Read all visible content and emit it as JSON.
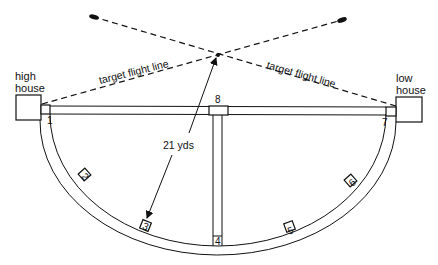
{
  "diagram": {
    "type": "skeet-field-layout",
    "houses": {
      "high": {
        "label_line1": "high",
        "label_line2": "house"
      },
      "low": {
        "label_line1": "low",
        "label_line2": "house"
      }
    },
    "flight_lines": {
      "left_label": "target flight line",
      "right_label": "target flight line"
    },
    "distance": {
      "label": "21 yds"
    },
    "stations": [
      {
        "number": "1"
      },
      {
        "number": "2"
      },
      {
        "number": "3"
      },
      {
        "number": "4"
      },
      {
        "number": "5"
      },
      {
        "number": "6"
      },
      {
        "number": "7"
      },
      {
        "number": "8"
      }
    ],
    "colors": {
      "ink": "#111111",
      "background": "#ffffff"
    }
  }
}
